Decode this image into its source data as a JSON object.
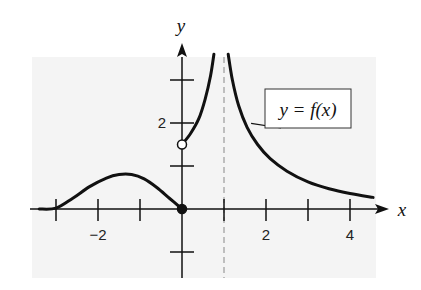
{
  "chart_data": {
    "type": "line",
    "title": "",
    "xlabel": "x",
    "ylabel": "y",
    "xlim": [
      -3.4,
      4.6
    ],
    "ylim": [
      -1.6,
      3.6
    ],
    "grid": false,
    "background_color": "#f4f4f4",
    "x_ticks": [
      -3,
      -2,
      -1,
      1,
      2,
      3,
      4
    ],
    "x_tick_labels": [
      {
        "value": -2,
        "label": "−2"
      },
      {
        "value": 2,
        "label": "2"
      },
      {
        "value": 4,
        "label": "4"
      }
    ],
    "y_ticks": [
      -1,
      1,
      2,
      3
    ],
    "y_tick_labels": [
      {
        "value": 2,
        "label": "2"
      }
    ],
    "vertical_asymptote": {
      "x": 1,
      "style": "dashed",
      "color": "#888888"
    },
    "series": [
      {
        "name": "y = f(x) left branch",
        "points": [
          [
            -3.4,
            0.0
          ],
          [
            -3.0,
            0.02
          ],
          [
            -2.6,
            0.25
          ],
          [
            -2.2,
            0.52
          ],
          [
            -1.8,
            0.72
          ],
          [
            -1.5,
            0.8
          ],
          [
            -1.2,
            0.8
          ],
          [
            -0.9,
            0.7
          ],
          [
            -0.6,
            0.5
          ],
          [
            -0.3,
            0.25
          ],
          [
            0.0,
            0.0
          ]
        ]
      },
      {
        "name": "y = f(x) middle branch",
        "points": [
          [
            0.0,
            1.5
          ],
          [
            0.2,
            1.75
          ],
          [
            0.4,
            2.1
          ],
          [
            0.55,
            2.55
          ],
          [
            0.68,
            3.1
          ],
          [
            0.76,
            3.6
          ]
        ]
      },
      {
        "name": "y = f(x) right branch",
        "points": [
          [
            1.1,
            3.6
          ],
          [
            1.2,
            3.0
          ],
          [
            1.35,
            2.4
          ],
          [
            1.55,
            1.9
          ],
          [
            1.8,
            1.5
          ],
          [
            2.1,
            1.17
          ],
          [
            2.5,
            0.88
          ],
          [
            3.0,
            0.63
          ],
          [
            3.5,
            0.47
          ],
          [
            4.0,
            0.36
          ],
          [
            4.55,
            0.27
          ]
        ]
      }
    ],
    "points": [
      {
        "x": 0,
        "y": 0,
        "style": "filled",
        "label": "closed dot at origin"
      },
      {
        "x": 0,
        "y": 1.5,
        "style": "open",
        "label": "open dot on y-axis"
      }
    ],
    "legend": {
      "label": "y = f(x)",
      "position": "upper right",
      "pointer_to": [
        1.55,
        1.9
      ]
    }
  },
  "labels": {
    "x_axis": "x",
    "y_axis": "y",
    "legend_text": "y = f(x)"
  }
}
